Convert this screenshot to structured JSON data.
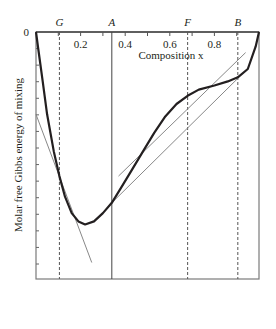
{
  "chart_data": {
    "type": "line",
    "title": "",
    "xlabel": "Composition x",
    "ylabel": "Molar free Gibbs energy of mixing",
    "xlim": [
      0,
      1
    ],
    "ylim_label": "0",
    "x_ticks": [
      {
        "value": 0.2,
        "label": "0.2"
      },
      {
        "value": 0.4,
        "label": "0.4"
      },
      {
        "value": 0.6,
        "label": "0.6"
      },
      {
        "value": 0.8,
        "label": "0.8"
      }
    ],
    "x_minor_ticks": [
      0.1,
      0.2,
      0.3,
      0.4,
      0.5,
      0.6,
      0.7,
      0.8,
      0.9
    ],
    "y_tick_count": 14,
    "y_zero_label": "0",
    "markers": [
      {
        "name": "G",
        "x": 0.105,
        "style": "dashed"
      },
      {
        "name": "A",
        "x": 0.34,
        "style": "solid"
      },
      {
        "name": "F",
        "x": 0.68,
        "style": "dashed"
      },
      {
        "name": "B",
        "x": 0.905,
        "style": "dashed"
      }
    ],
    "series": [
      {
        "name": "Gibbs energy curve",
        "color": "#231f20",
        "points": [
          [
            0.0,
            0.0
          ],
          [
            0.01,
            -0.08
          ],
          [
            0.03,
            -0.24
          ],
          [
            0.05,
            -0.4
          ],
          [
            0.08,
            -0.58
          ],
          [
            0.105,
            -0.7
          ],
          [
            0.13,
            -0.8
          ],
          [
            0.16,
            -0.88
          ],
          [
            0.19,
            -0.92
          ],
          [
            0.22,
            -0.935
          ],
          [
            0.26,
            -0.92
          ],
          [
            0.3,
            -0.88
          ],
          [
            0.34,
            -0.83
          ],
          [
            0.38,
            -0.76
          ],
          [
            0.43,
            -0.67
          ],
          [
            0.48,
            -0.58
          ],
          [
            0.53,
            -0.49
          ],
          [
            0.58,
            -0.41
          ],
          [
            0.63,
            -0.35
          ],
          [
            0.68,
            -0.31
          ],
          [
            0.73,
            -0.28
          ],
          [
            0.8,
            -0.26
          ],
          [
            0.86,
            -0.24
          ],
          [
            0.905,
            -0.22
          ],
          [
            0.95,
            -0.18
          ],
          [
            0.985,
            -0.07
          ],
          [
            1.0,
            0.0
          ]
        ]
      }
    ],
    "tangent_lines": [
      {
        "name": "tangent-at-G",
        "color": "#888888",
        "from": [
          0.0,
          -0.4
        ],
        "to": [
          0.25,
          -1.12
        ]
      },
      {
        "name": "tangent-at-F",
        "color": "#888888",
        "from": [
          0.37,
          -0.7
        ],
        "to": [
          0.94,
          -0.1
        ]
      },
      {
        "name": "tangent-A-B",
        "color": "#888888",
        "from": [
          0.34,
          -0.83
        ],
        "to": [
          0.91,
          -0.22
        ]
      }
    ]
  }
}
